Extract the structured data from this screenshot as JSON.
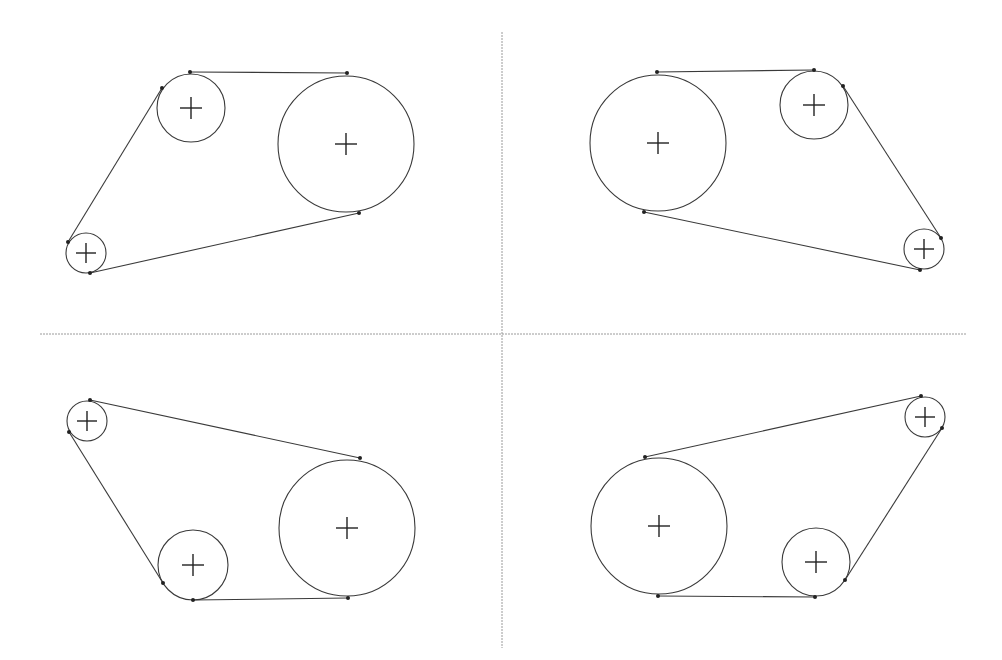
{
  "diagram": {
    "title": "Belt drive pulley configurations (four mirrored variants)",
    "colors": {
      "background": "#ffffff",
      "stroke": "#3a3a3a",
      "divider": "#9a9a9a",
      "point": "#222222"
    },
    "dividers": {
      "vertical": {
        "x": 502,
        "y1": 32,
        "y2": 648
      },
      "horizontal": {
        "y": 334,
        "x1": 40,
        "x2": 966
      }
    },
    "quadrants": [
      {
        "id": "top-left",
        "pulleys": [
          {
            "name": "large",
            "cx": 346,
            "cy": 144,
            "r": 68
          },
          {
            "name": "medium",
            "cx": 191,
            "cy": 108,
            "r": 34
          },
          {
            "name": "small",
            "cx": 86,
            "cy": 253,
            "r": 20
          }
        ],
        "belt_segments": [
          {
            "x1": 190,
            "y1": 72,
            "x2": 347,
            "y2": 73
          },
          {
            "x1": 162,
            "y1": 88,
            "x2": 68,
            "y2": 242
          },
          {
            "x1": 90,
            "y1": 273,
            "x2": 359,
            "y2": 213
          }
        ]
      },
      {
        "id": "top-right",
        "pulleys": [
          {
            "name": "large",
            "cx": 658,
            "cy": 143,
            "r": 68
          },
          {
            "name": "medium",
            "cx": 814,
            "cy": 105,
            "r": 34
          },
          {
            "name": "small",
            "cx": 924,
            "cy": 249,
            "r": 20
          }
        ],
        "belt_segments": [
          {
            "x1": 657,
            "y1": 72,
            "x2": 814,
            "y2": 70
          },
          {
            "x1": 843,
            "y1": 86,
            "x2": 941,
            "y2": 238
          },
          {
            "x1": 920,
            "y1": 270,
            "x2": 644,
            "y2": 212
          }
        ]
      },
      {
        "id": "bottom-left",
        "pulleys": [
          {
            "name": "large",
            "cx": 347,
            "cy": 528,
            "r": 68
          },
          {
            "name": "medium",
            "cx": 193,
            "cy": 565,
            "r": 35
          },
          {
            "name": "small",
            "cx": 87,
            "cy": 421,
            "r": 20
          }
        ],
        "belt_segments": [
          {
            "x1": 90,
            "y1": 400,
            "x2": 360,
            "y2": 458
          },
          {
            "x1": 69,
            "y1": 432,
            "x2": 163,
            "y2": 583
          },
          {
            "x1": 193,
            "y1": 600,
            "x2": 348,
            "y2": 598
          }
        ]
      },
      {
        "id": "bottom-right",
        "pulleys": [
          {
            "name": "large",
            "cx": 659,
            "cy": 526,
            "r": 68
          },
          {
            "name": "medium",
            "cx": 816,
            "cy": 562,
            "r": 34
          },
          {
            "name": "small",
            "cx": 925,
            "cy": 417,
            "r": 20
          }
        ],
        "belt_segments": [
          {
            "x1": 645,
            "y1": 457,
            "x2": 921,
            "y2": 396
          },
          {
            "x1": 942,
            "y1": 428,
            "x2": 845,
            "y2": 580
          },
          {
            "x1": 815,
            "y1": 597,
            "x2": 658,
            "y2": 596
          }
        ]
      }
    ]
  }
}
